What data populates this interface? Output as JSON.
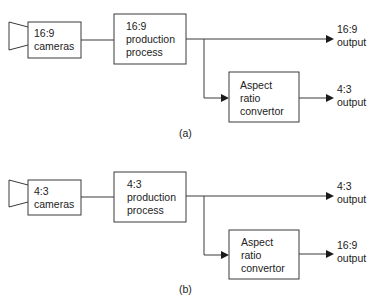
{
  "diagram": {
    "type": "block-diagram",
    "panels": [
      {
        "id": "a",
        "caption": "(a)",
        "camera": {
          "line1": "16:9",
          "line2": "cameras"
        },
        "production": {
          "line1": "16:9",
          "line2": "production",
          "line3": "process"
        },
        "converter": {
          "line1": "Aspect",
          "line2": "ratio",
          "line3": "convertor"
        },
        "output_main": {
          "line1": "16:9",
          "line2": "output"
        },
        "output_converted": {
          "line1": "4:3",
          "line2": "output"
        }
      },
      {
        "id": "b",
        "caption": "(b)",
        "camera": {
          "line1": "4:3",
          "line2": "cameras"
        },
        "production": {
          "line1": "4:3",
          "line2": "production",
          "line3": "process"
        },
        "converter": {
          "line1": "Aspect",
          "line2": "ratio",
          "line3": "convertor"
        },
        "output_main": {
          "line1": "4:3",
          "line2": "output"
        },
        "output_converted": {
          "line1": "16:9",
          "line2": "output"
        }
      }
    ],
    "colors": {
      "stroke": "#3a3a3a",
      "text": "#222222",
      "background": "#ffffff"
    }
  }
}
